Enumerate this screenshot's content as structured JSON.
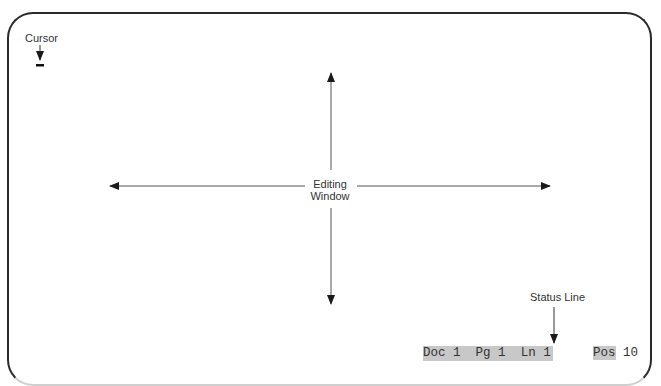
{
  "diagram": {
    "type": "word-processor-screen-layout",
    "cursor_label": "Cursor",
    "center_label_line1": "Editing",
    "center_label_line2": "Window",
    "status_line_label": "Status Line",
    "status_bar": {
      "doc_label": "Doc",
      "doc_value": "1",
      "page_label": "Pg",
      "page_value": "1",
      "line_label": "Ln",
      "line_value": "1",
      "pos_label": "Pos",
      "pos_value": "10"
    },
    "colors": {
      "frame": "#2a2a2a",
      "highlight": "#c8c8c8",
      "text": "#333333"
    }
  }
}
